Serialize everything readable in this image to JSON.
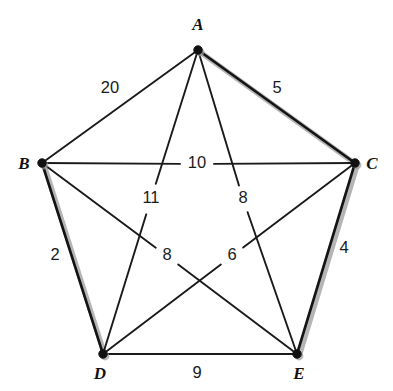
{
  "figure": {
    "background_color": "#ffffff",
    "line_color": "#1a1a1a",
    "highlight_shadow_color": "#a8a8a8"
  },
  "vertices": [
    {
      "id": "A",
      "label": "A",
      "x": 198,
      "y": 50,
      "label_x": 198,
      "label_y": 30,
      "label_anchor": "middle"
    },
    {
      "id": "B",
      "label": "B",
      "x": 42,
      "y": 163,
      "label_x": 24,
      "label_y": 169,
      "label_anchor": "middle"
    },
    {
      "id": "C",
      "label": "C",
      "x": 355,
      "y": 163,
      "label_x": 372,
      "label_y": 169,
      "label_anchor": "middle"
    },
    {
      "id": "D",
      "label": "D",
      "x": 103,
      "y": 354,
      "label_x": 100,
      "label_y": 379,
      "label_anchor": "middle"
    },
    {
      "id": "E",
      "label": "E",
      "x": 297,
      "y": 354,
      "label_x": 299,
      "label_y": 379,
      "label_anchor": "middle"
    }
  ],
  "edges": [
    {
      "from": "A",
      "to": "B",
      "weight": "20",
      "label_x": 110,
      "label_y": 89,
      "highlighted": false,
      "gap": 0
    },
    {
      "from": "A",
      "to": "C",
      "weight": "5",
      "label_x": 277,
      "label_y": 89,
      "highlighted": true,
      "gap": 0
    },
    {
      "from": "B",
      "to": "C",
      "weight": "10",
      "label_x": 197,
      "label_y": 164,
      "highlighted": false,
      "gap": 17
    },
    {
      "from": "B",
      "to": "D",
      "weight": "2",
      "label_x": 55,
      "label_y": 256,
      "highlighted": true,
      "gap": 0
    },
    {
      "from": "C",
      "to": "E",
      "weight": "4",
      "label_x": 344,
      "label_y": 249,
      "highlighted": true,
      "gap": 0
    },
    {
      "from": "D",
      "to": "E",
      "weight": "9",
      "label_x": 197,
      "label_y": 374,
      "highlighted": false,
      "gap": 0
    },
    {
      "from": "A",
      "to": "D",
      "weight": "11",
      "label_x": 151,
      "label_y": 199,
      "highlighted": false,
      "gap": 16
    },
    {
      "from": "A",
      "to": "E",
      "weight": "8",
      "label_x": 243,
      "label_y": 199,
      "highlighted": false,
      "gap": 14
    },
    {
      "from": "B",
      "to": "E",
      "weight": "8",
      "label_x": 167,
      "label_y": 256,
      "highlighted": false,
      "gap": 14
    },
    {
      "from": "C",
      "to": "D",
      "weight": "6",
      "label_x": 232,
      "label_y": 256,
      "highlighted": false,
      "gap": 14
    }
  ],
  "chart_data": {
    "type": "diagram",
    "nodes": [
      "A",
      "B",
      "C",
      "D",
      "E"
    ],
    "weighted_edges": [
      {
        "edge": "A-B",
        "weight": 20
      },
      {
        "edge": "A-C",
        "weight": 5
      },
      {
        "edge": "A-D",
        "weight": 11
      },
      {
        "edge": "A-E",
        "weight": 8
      },
      {
        "edge": "B-C",
        "weight": 10
      },
      {
        "edge": "B-D",
        "weight": 2
      },
      {
        "edge": "B-E",
        "weight": 8
      },
      {
        "edge": "C-D",
        "weight": 6
      },
      {
        "edge": "C-E",
        "weight": 4
      },
      {
        "edge": "D-E",
        "weight": 9
      }
    ],
    "highlighted_edges": [
      "A-C",
      "B-D",
      "C-E"
    ]
  }
}
